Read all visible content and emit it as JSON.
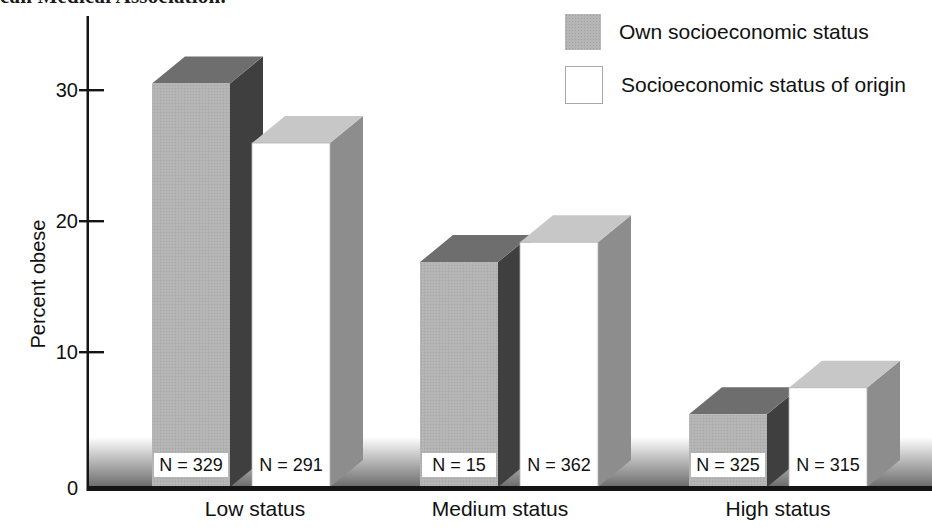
{
  "caption_fragment": "can Medical Association.",
  "chart_data": {
    "type": "bar",
    "variant": "3d-grouped",
    "title": "",
    "ylabel": "Percent obese",
    "xlabel": "",
    "categories": [
      "Low status",
      "Medium status",
      "High status"
    ],
    "yticks": [
      "0",
      "10",
      "20",
      "30"
    ],
    "ylim": [
      0,
      33
    ],
    "grid": false,
    "legend_position": "top-right",
    "n_label_prefix": "N = ",
    "series": [
      {
        "name": "Own socioeconomic status",
        "values": [
          30.5,
          17,
          5.5
        ],
        "sample_sizes": [
          329,
          15,
          325
        ],
        "front_color": "#b6b6b6",
        "top_color": "#6e6e6e",
        "side_color": "#3f3f3f",
        "front_stroke": ""
      },
      {
        "name": "Socioeconomic status of origin",
        "values": [
          26,
          18.5,
          7.5
        ],
        "sample_sizes": [
          291,
          362,
          315
        ],
        "front_color": "#ffffff",
        "top_color": "#c7c7c7",
        "side_color": "#8d8d8d",
        "front_stroke": "#b3b3b3"
      }
    ],
    "colors": {
      "axis": "#151515",
      "floor_band_top": "#ffffff",
      "floor_band_bottom": "#6e6e6e",
      "n_label_box": "#ffffff",
      "text": "#111111"
    }
  }
}
